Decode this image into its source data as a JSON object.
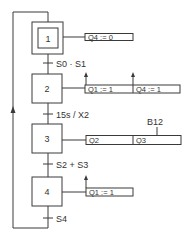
{
  "grafcet": {
    "steps": [
      {
        "id": "1",
        "label": "1",
        "initial": true
      },
      {
        "id": "2",
        "label": "2",
        "initial": false
      },
      {
        "id": "3",
        "label": "3",
        "initial": false
      },
      {
        "id": "4",
        "label": "4",
        "initial": false
      }
    ],
    "transitions": [
      {
        "from": "1",
        "to": "2",
        "condition": "S0 · S1"
      },
      {
        "from": "2",
        "to": "3",
        "condition": "15s / X2"
      },
      {
        "from": "3",
        "to": "4",
        "condition": "S2 + S3"
      },
      {
        "from": "4",
        "to": "1",
        "condition": "S4"
      }
    ],
    "actions": {
      "step1": [
        "Q4 := 0"
      ],
      "step2": [
        "Q1 := 1",
        "Q4 := 1"
      ],
      "step3": [
        "Q2",
        "Q3"
      ],
      "step4": [
        "Q1 := 1"
      ]
    },
    "action_annotations": {
      "step3_q3": "B12"
    }
  }
}
